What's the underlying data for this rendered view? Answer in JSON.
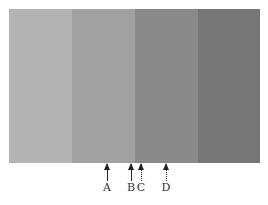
{
  "figure": {
    "bands": [
      {
        "name": "band-1",
        "color": "#b3b3b3",
        "left": 9,
        "width": 63
      },
      {
        "name": "band-2",
        "color": "#a1a1a1",
        "left": 72,
        "width": 63
      },
      {
        "name": "band-3",
        "color": "#8a8a8a",
        "left": 135,
        "width": 63
      },
      {
        "name": "band-4",
        "color": "#767676",
        "left": 198,
        "width": 62
      }
    ],
    "markers": [
      {
        "label": "A",
        "x": 107,
        "style": "solid"
      },
      {
        "label": "B",
        "x": 131,
        "style": "solid"
      },
      {
        "label": "C",
        "x": 141,
        "style": "dashed"
      },
      {
        "label": "D",
        "x": 166,
        "style": "dashed"
      }
    ]
  }
}
